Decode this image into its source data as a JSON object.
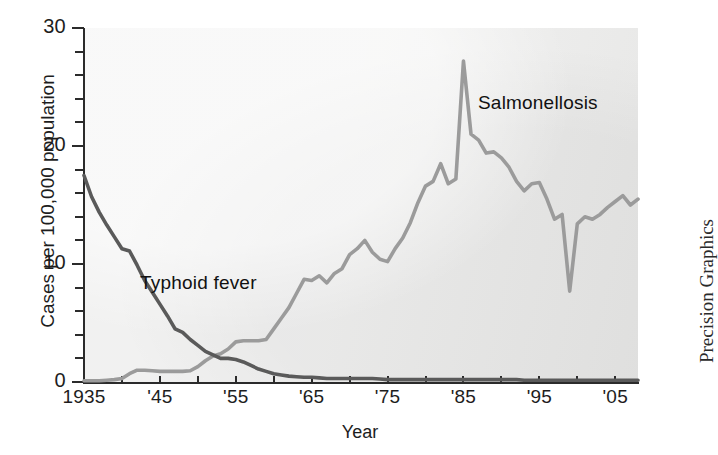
{
  "chart_data": {
    "type": "line",
    "title": "",
    "xlabel": "Year",
    "ylabel": "Cases per 100,000 population",
    "xlim": [
      1935,
      2008
    ],
    "ylim": [
      0,
      30
    ],
    "grid": false,
    "legend_position": "inline-annotations",
    "xticklabels": [
      "1935",
      "'45",
      "'55",
      "'65",
      "'75",
      "'85",
      "'95",
      "'05"
    ],
    "xtickvalues": [
      1935,
      1945,
      1955,
      1965,
      1975,
      1985,
      1995,
      2005
    ],
    "xminortick_interval": 5,
    "yticklabels": [
      "0",
      "10",
      "20",
      "30"
    ],
    "ytickvalues": [
      0,
      10,
      20,
      30
    ],
    "yminortick_interval": 2,
    "annotations": [
      {
        "text": "Typhoid fever",
        "x": 1948,
        "y": 8.6
      },
      {
        "text": "Salmonellosis",
        "x": 1986,
        "y": 23.2
      }
    ],
    "credit": "Precision Graphics",
    "series": [
      {
        "name": "Typhoid fever",
        "color": "#5a5a5a",
        "x": [
          1935,
          1936,
          1937,
          1938,
          1939,
          1940,
          1941,
          1942,
          1943,
          1944,
          1945,
          1946,
          1947,
          1948,
          1949,
          1950,
          1951,
          1952,
          1953,
          1954,
          1955,
          1956,
          1957,
          1958,
          1959,
          1960,
          1961,
          1962,
          1963,
          1964,
          1965,
          1966,
          1967,
          1968,
          1969,
          1970,
          1971,
          1972,
          1973,
          1974,
          1975,
          1976,
          1977,
          1978,
          1979,
          1980,
          1981,
          1982,
          1983,
          1984,
          1985,
          1986,
          1987,
          1988,
          1989,
          1990,
          1991,
          1992,
          1993,
          1994,
          1995,
          1996,
          1997,
          1998,
          1999,
          2000,
          2001,
          2002,
          2003,
          2004,
          2005,
          2006,
          2007,
          2008
        ],
        "values": [
          17.5,
          15.7,
          14.4,
          13.3,
          12.3,
          11.3,
          11.1,
          9.9,
          8.6,
          7.6,
          6.6,
          5.6,
          4.5,
          4.2,
          3.6,
          3.1,
          2.6,
          2.3,
          2.0,
          2.0,
          1.9,
          1.7,
          1.4,
          1.1,
          0.9,
          0.7,
          0.6,
          0.5,
          0.45,
          0.4,
          0.4,
          0.35,
          0.3,
          0.3,
          0.3,
          0.3,
          0.3,
          0.3,
          0.3,
          0.25,
          0.2,
          0.2,
          0.2,
          0.2,
          0.2,
          0.2,
          0.2,
          0.2,
          0.2,
          0.2,
          0.2,
          0.2,
          0.2,
          0.2,
          0.2,
          0.2,
          0.2,
          0.2,
          0.15,
          0.15,
          0.15,
          0.15,
          0.15,
          0.15,
          0.15,
          0.15,
          0.15,
          0.15,
          0.15,
          0.15,
          0.15,
          0.15,
          0.15,
          0.15
        ]
      },
      {
        "name": "Salmonellosis",
        "color": "#9b9b9b",
        "x": [
          1935,
          1936,
          1937,
          1938,
          1939,
          1940,
          1941,
          1942,
          1943,
          1944,
          1945,
          1946,
          1947,
          1948,
          1949,
          1950,
          1951,
          1952,
          1953,
          1954,
          1955,
          1956,
          1957,
          1958,
          1959,
          1960,
          1961,
          1962,
          1963,
          1964,
          1965,
          1966,
          1967,
          1968,
          1969,
          1970,
          1971,
          1972,
          1973,
          1974,
          1975,
          1976,
          1977,
          1978,
          1979,
          1980,
          1981,
          1982,
          1983,
          1984,
          1985,
          1986,
          1987,
          1988,
          1989,
          1990,
          1991,
          1992,
          1993,
          1994,
          1995,
          1996,
          1997,
          1998,
          1999,
          2000,
          2001,
          2002,
          2003,
          2004,
          2005,
          2006,
          2007,
          2008
        ],
        "values": [
          0.1,
          0.1,
          0.1,
          0.15,
          0.2,
          0.3,
          0.7,
          1.0,
          1.0,
          0.95,
          0.9,
          0.9,
          0.9,
          0.9,
          0.95,
          1.3,
          1.8,
          2.2,
          2.4,
          2.8,
          3.4,
          3.5,
          3.5,
          3.5,
          3.6,
          4.5,
          5.4,
          6.3,
          7.5,
          8.7,
          8.6,
          9.0,
          8.4,
          9.2,
          9.6,
          10.8,
          11.3,
          12.0,
          11.0,
          10.4,
          10.2,
          11.3,
          12.2,
          13.5,
          15.2,
          16.6,
          17.0,
          18.5,
          16.8,
          17.2,
          27.2,
          21.0,
          20.5,
          19.4,
          19.5,
          19.0,
          18.2,
          17.0,
          16.2,
          16.8,
          16.9,
          15.5,
          13.8,
          14.2,
          7.7,
          13.4,
          14.0,
          13.8,
          14.2,
          14.8,
          15.3,
          15.8,
          15.0,
          15.5
        ]
      }
    ]
  }
}
